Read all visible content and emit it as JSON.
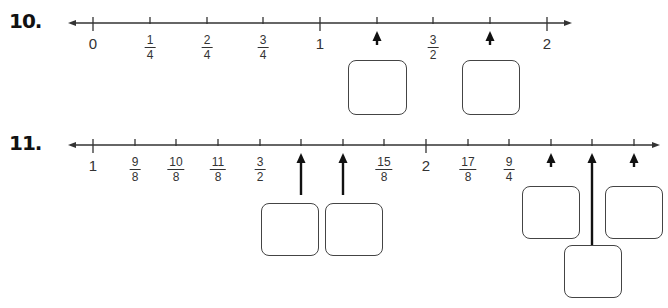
{
  "problems": [
    {
      "number": "10.",
      "number_line": {
        "y": 23,
        "x_start": 68,
        "x_end": 572,
        "ticks": [
          {
            "x": 93,
            "label": "0",
            "type": "whole",
            "major": true
          },
          {
            "x": 150,
            "num": "1",
            "den": "4",
            "type": "frac"
          },
          {
            "x": 207,
            "num": "2",
            "den": "4",
            "type": "frac"
          },
          {
            "x": 263,
            "num": "3",
            "den": "4",
            "type": "frac"
          },
          {
            "x": 320,
            "label": "1",
            "type": "whole",
            "major": true
          },
          {
            "x": 377,
            "type": "blank",
            "arrow": true
          },
          {
            "x": 433,
            "num": "3",
            "den": "2",
            "type": "frac"
          },
          {
            "x": 490,
            "type": "blank",
            "arrow": true
          },
          {
            "x": 547,
            "label": "2",
            "type": "whole",
            "major": true
          }
        ]
      },
      "answer_boxes": [
        {
          "x": 348,
          "y": 60,
          "w": 59,
          "h": 55
        },
        {
          "x": 462,
          "y": 60,
          "w": 58,
          "h": 55
        }
      ]
    },
    {
      "number": "11.",
      "number_line": {
        "y": 145,
        "x_start": 68,
        "x_end": 660,
        "ticks": [
          {
            "x": 93,
            "label": "1",
            "type": "whole",
            "major": true
          },
          {
            "x": 135,
            "num": "9",
            "den": "8",
            "type": "frac"
          },
          {
            "x": 176,
            "num": "10",
            "den": "8",
            "type": "frac"
          },
          {
            "x": 218,
            "num": "11",
            "den": "8",
            "type": "frac"
          },
          {
            "x": 260,
            "num": "3",
            "den": "2",
            "type": "frac"
          },
          {
            "x": 301,
            "type": "blank",
            "arrow": true
          },
          {
            "x": 343,
            "type": "blank",
            "arrow": true
          },
          {
            "x": 384,
            "num": "15",
            "den": "8",
            "type": "frac"
          },
          {
            "x": 426,
            "label": "2",
            "type": "whole",
            "major": true
          },
          {
            "x": 468,
            "num": "17",
            "den": "8",
            "type": "frac"
          },
          {
            "x": 509,
            "num": "9",
            "den": "4",
            "type": "frac"
          },
          {
            "x": 551,
            "type": "blank",
            "arrow": true
          },
          {
            "x": 592,
            "type": "blank",
            "arrow": true,
            "long": true
          },
          {
            "x": 634,
            "type": "blank",
            "arrow": true
          }
        ]
      },
      "answer_boxes": [
        {
          "x": 261,
          "y": 203,
          "w": 58,
          "h": 53
        },
        {
          "x": 325,
          "y": 203,
          "w": 58,
          "h": 53
        },
        {
          "x": 522,
          "y": 186,
          "w": 58,
          "h": 53
        },
        {
          "x": 605,
          "y": 186,
          "w": 58,
          "h": 53
        },
        {
          "x": 564,
          "y": 245,
          "w": 58,
          "h": 53
        }
      ]
    }
  ],
  "colors": {
    "line": "#333333",
    "arrow": "#111111",
    "box_border": "#444444"
  }
}
